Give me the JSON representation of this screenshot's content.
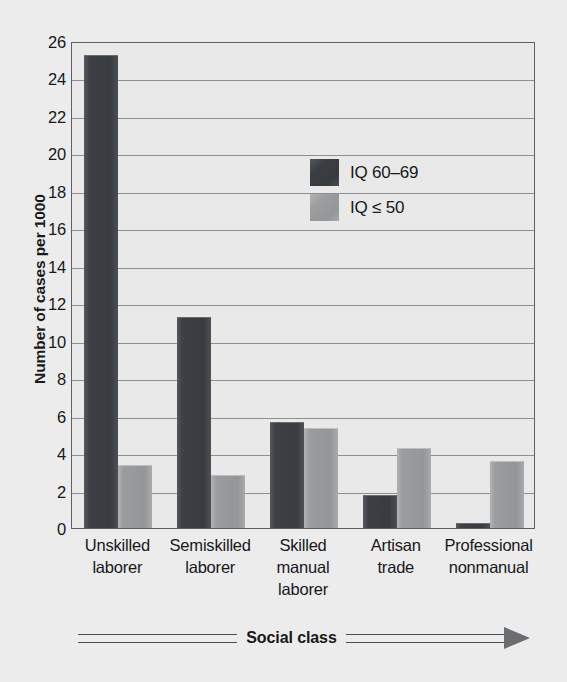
{
  "chart_data": {
    "type": "bar",
    "title": "",
    "xlabel": "Social class",
    "ylabel": "Number of cases per 1000",
    "ylim": [
      0,
      26
    ],
    "ytick_step": 2,
    "yticks": [
      26,
      24,
      22,
      20,
      18,
      16,
      14,
      12,
      10,
      8,
      6,
      4,
      2,
      0
    ],
    "grid": true,
    "legend_position": "upper-center-right",
    "categories": [
      "Unskilled\nlaborer",
      "Semiskilled\nlaborer",
      "Skilled\nmanual\nlaborer",
      "Artisan\ntrade",
      "Professional\nnonmanual"
    ],
    "category_lines": [
      [
        "Unskilled",
        "laborer"
      ],
      [
        "Semiskilled",
        "laborer"
      ],
      [
        "Skilled",
        "manual",
        "laborer"
      ],
      [
        "Artisan",
        "trade"
      ],
      [
        "Professional",
        "nonmanual"
      ]
    ],
    "series": [
      {
        "name": "IQ 60–69",
        "color": "#3a3d41",
        "values": [
          25.2,
          11.2,
          5.6,
          1.7,
          0.2
        ]
      },
      {
        "name": "IQ ≤ 50",
        "color": "#9a9c9d",
        "values": [
          3.3,
          2.8,
          5.3,
          4.2,
          3.5
        ]
      }
    ]
  },
  "colors": {
    "background": "#ececec",
    "plot_background": "#e9e9e9",
    "frame": "#5d5f61",
    "gridline": "#8d9092",
    "series_dark": "#3a3d41",
    "series_light": "#9a9c9d",
    "text": "#17181a"
  },
  "legend": {
    "items": [
      {
        "label": "IQ 60–69",
        "swatch": "dark"
      },
      {
        "label": "IQ ≤ 50",
        "swatch": "light"
      }
    ]
  },
  "axes": {
    "y_title": "Number of cases per 1000",
    "x_title": "Social class"
  }
}
